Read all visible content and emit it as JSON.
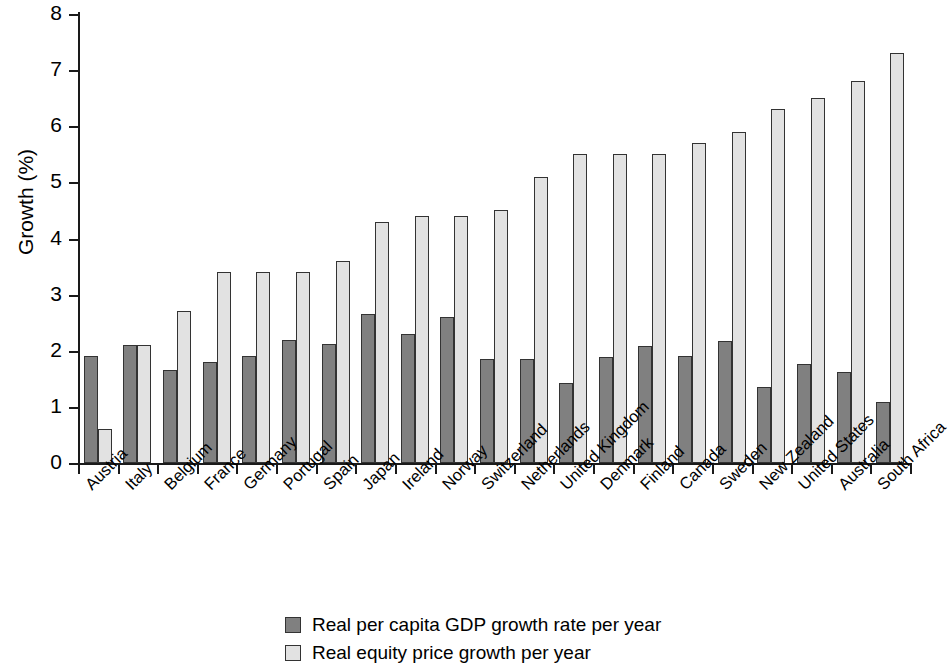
{
  "chart_data": {
    "type": "bar",
    "title": "",
    "subtitle": "",
    "xlabel": "",
    "ylabel": "Growth (%)",
    "ylim": [
      0,
      8
    ],
    "ytick_labels": [
      "8",
      "7",
      "6",
      "5",
      "4",
      "3",
      "2",
      "1",
      "0"
    ],
    "ytick_values": [
      8,
      7,
      6,
      5,
      4,
      3,
      2,
      1,
      0
    ],
    "grid": false,
    "legend_position": "bottom-center",
    "categories": [
      "Austria",
      "Italy",
      "Belgium",
      "France",
      "Germany",
      "Portugal",
      "Spain",
      "Japan",
      "Ireland",
      "Norway",
      "Switzerland",
      "Netherlands",
      "United Kingdom",
      "Denmark",
      "Finland",
      "Canada",
      "Sweden",
      "New Zealand",
      "United States",
      "Australia",
      "South Africa"
    ],
    "series": [
      {
        "name": "Real per capita GDP growth rate per year",
        "color": "#808080",
        "values": [
          1.9,
          2.1,
          1.65,
          1.8,
          1.9,
          2.2,
          2.12,
          2.65,
          2.3,
          2.6,
          1.86,
          1.85,
          1.43,
          1.89,
          2.09,
          1.9,
          2.18,
          1.36,
          1.77,
          1.63,
          1.08
        ]
      },
      {
        "name": "Real equity price growth per year",
        "color": "#e2e2e2",
        "values": [
          0.6,
          2.1,
          2.7,
          3.4,
          3.4,
          3.4,
          3.6,
          4.3,
          4.4,
          4.4,
          4.5,
          5.1,
          5.5,
          5.5,
          5.5,
          5.7,
          5.9,
          6.3,
          6.5,
          6.8,
          7.3
        ]
      }
    ]
  },
  "legend": {
    "items": [
      {
        "label": "Real per capita GDP growth rate per year",
        "swatch": "gdp"
      },
      {
        "label": "Real equity price growth per year",
        "swatch": "equity"
      }
    ]
  }
}
